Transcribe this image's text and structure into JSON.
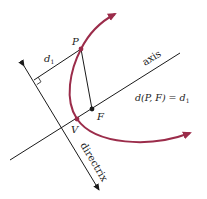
{
  "figure": {
    "labels": {
      "P": "P",
      "F": "F",
      "V": "V",
      "d1": "d",
      "d1_sub": "1",
      "axis": "axis",
      "directrix": "directrix",
      "equation_main": "d(P, F) = d",
      "equation_sub": "1"
    },
    "colors": {
      "curve": "#9b2c4a",
      "lines": "#1a1a1a",
      "background": "#ffffff"
    },
    "points": {
      "P": [
        81,
        49
      ],
      "F": [
        92,
        109
      ],
      "V": [
        77,
        119
      ],
      "perpendicular_foot": [
        34,
        80
      ]
    }
  }
}
